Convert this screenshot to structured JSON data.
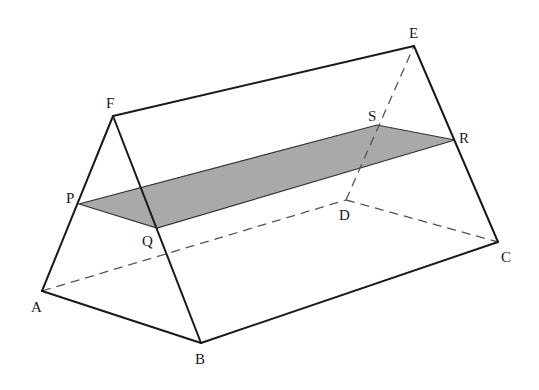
{
  "diagram": {
    "colors": {
      "edge": "#1a1a1a",
      "hidden_edge": "#555555",
      "section_fill": "#a9a9a9",
      "background": "#ffffff"
    },
    "vertices": {
      "A": {
        "label": "A",
        "x": 42,
        "y": 291
      },
      "B": {
        "label": "B",
        "x": 201,
        "y": 343
      },
      "C": {
        "label": "C",
        "x": 498,
        "y": 242
      },
      "D": {
        "label": "D",
        "x": 346,
        "y": 200
      },
      "E": {
        "label": "E",
        "x": 414,
        "y": 46
      },
      "F": {
        "label": "F",
        "x": 113,
        "y": 116
      },
      "P": {
        "label": "P",
        "x": 79,
        "y": 204
      },
      "Q": {
        "label": "Q",
        "x": 157,
        "y": 228
      },
      "R": {
        "label": "R",
        "x": 455,
        "y": 140
      },
      "S": {
        "label": "S",
        "x": 377,
        "y": 125
      }
    },
    "labels": {
      "A": "A",
      "B": "B",
      "C": "C",
      "D": "D",
      "E": "E",
      "F": "F",
      "P": "P",
      "Q": "Q",
      "R": "R",
      "S": "S"
    },
    "visible_edges": [
      "FA",
      "FB",
      "FE",
      "EC",
      "AB",
      "BC"
    ],
    "hidden_edges": [
      "AD",
      "DC",
      "DE"
    ],
    "shaded_section": [
      "P",
      "Q",
      "R",
      "S"
    ]
  }
}
